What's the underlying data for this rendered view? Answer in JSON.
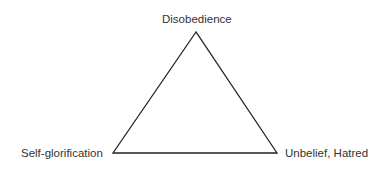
{
  "diagram": {
    "type": "triangle",
    "vertices": {
      "top": "Disobedience",
      "bottom_left": "Self-glorification",
      "bottom_right": "Unbelief, Hatred"
    },
    "stroke_color": "#222222"
  }
}
